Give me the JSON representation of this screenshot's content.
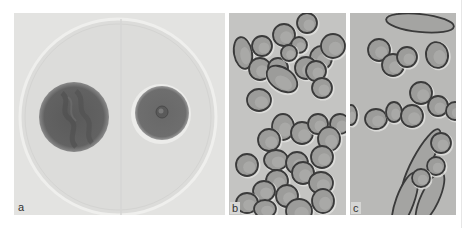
{
  "figure": {
    "panels": [
      {
        "id": "a",
        "label": "a",
        "description": "Petri dish with two fungal colonies"
      },
      {
        "id": "b",
        "label": "b",
        "description": "Micrograph of yeast-like cells"
      },
      {
        "id": "c",
        "label": "c",
        "description": "Micrograph of cells with elongated hyphal forms"
      }
    ]
  },
  "colors": {
    "panel_a_bg": "#e3e3e1",
    "dish_fill": "#dcdcda",
    "dish_rim": "#eeeeec",
    "colony_large": "#606060",
    "colony_small": "#6a6a6a",
    "panel_b_bg": "#c4c4c2",
    "panel_c_bg": "#b9b9b7",
    "cell_wall": "#3a3a3a",
    "cell_fill": "#9c9c9a",
    "cell_halo": "#e2e2e0"
  },
  "cells_b": [
    [
      14,
      40,
      9,
      16,
      -10
    ],
    [
      33,
      33,
      10,
      10,
      0
    ],
    [
      55,
      22,
      11,
      11,
      0
    ],
    [
      78,
      10,
      10,
      10,
      0
    ],
    [
      70,
      32,
      8,
      8,
      0
    ],
    [
      92,
      45,
      11,
      12,
      8
    ],
    [
      104,
      33,
      12,
      12,
      0
    ],
    [
      31,
      56,
      11,
      11,
      0
    ],
    [
      49,
      55,
      10,
      10,
      0
    ],
    [
      60,
      40,
      8,
      8,
      0
    ],
    [
      53,
      66,
      17,
      11,
      35
    ],
    [
      77,
      55,
      11,
      11,
      0
    ],
    [
      87,
      58,
      10,
      10,
      0
    ],
    [
      93,
      75,
      10,
      10,
      0
    ],
    [
      30,
      87,
      12,
      11,
      0
    ],
    [
      54,
      114,
      11,
      13,
      0
    ],
    [
      73,
      120,
      11,
      11,
      0
    ],
    [
      89,
      111,
      10,
      10,
      0
    ],
    [
      111,
      111,
      10,
      10,
      0
    ],
    [
      100,
      126,
      11,
      12,
      0
    ],
    [
      40,
      127,
      11,
      11,
      0
    ],
    [
      47,
      147,
      12,
      10,
      0
    ],
    [
      68,
      150,
      11,
      11,
      0
    ],
    [
      93,
      144,
      11,
      11,
      0
    ],
    [
      48,
      168,
      11,
      11,
      0
    ],
    [
      74,
      160,
      11,
      11,
      0
    ],
    [
      92,
      170,
      12,
      11,
      0
    ],
    [
      18,
      152,
      11,
      11,
      0
    ],
    [
      35,
      178,
      11,
      10,
      0
    ],
    [
      58,
      183,
      11,
      11,
      0
    ],
    [
      18,
      190,
      11,
      10,
      0
    ],
    [
      36,
      196,
      11,
      9,
      0
    ],
    [
      70,
      198,
      13,
      12,
      0
    ],
    [
      94,
      188,
      11,
      12,
      0
    ]
  ],
  "cells_c": [
    [
      29,
      37,
      11,
      11,
      0
    ],
    [
      43,
      52,
      11,
      11,
      0
    ],
    [
      57,
      44,
      10,
      10,
      0
    ],
    [
      87,
      42,
      11,
      13,
      -10
    ],
    [
      71,
      80,
      11,
      11,
      0
    ],
    [
      88,
      93,
      10,
      10,
      0
    ],
    [
      105,
      98,
      9,
      9,
      0
    ],
    [
      1,
      102,
      6,
      10,
      0
    ],
    [
      26,
      106,
      11,
      10,
      0
    ],
    [
      44,
      99,
      8,
      10,
      0
    ],
    [
      62,
      103,
      11,
      11,
      0
    ],
    [
      91,
      130,
      10,
      10,
      0
    ],
    [
      86,
      153,
      9,
      9,
      0
    ],
    [
      71,
      165,
      9,
      9,
      0
    ]
  ],
  "hyphae_c": [
    {
      "cx": 70,
      "cy": 10,
      "rx": 34,
      "ry": 9,
      "rot": 6
    },
    {
      "cx": 71,
      "cy": 150,
      "rx": 38,
      "ry": 9,
      "rot": -62
    },
    {
      "cx": 55,
      "cy": 188,
      "rx": 30,
      "ry": 9,
      "rot": -70
    },
    {
      "cx": 80,
      "cy": 185,
      "rx": 28,
      "ry": 9,
      "rot": -65
    }
  ]
}
